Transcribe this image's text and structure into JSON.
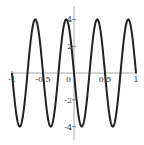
{
  "chart_data": {
    "type": "line",
    "title": "",
    "xlabel": "",
    "ylabel": "",
    "function": "-4*sin(4*pi*x)",
    "xlim": [
      -1,
      1
    ],
    "ylim": [
      -4.4,
      4.4
    ],
    "grid": false,
    "legend": null,
    "x_ticks": [
      -1,
      -0.5,
      0,
      0.5,
      1
    ],
    "x_tick_labels": [
      "-1",
      "-0.5",
      "0",
      "0.5",
      "1"
    ],
    "y_ticks": [
      -4,
      -2,
      2,
      4
    ],
    "y_tick_labels": [
      "-4",
      "-2",
      "2",
      "4"
    ],
    "series": [
      {
        "name": "f(x)",
        "color": "#222222",
        "x": [
          -1,
          -0.875,
          -0.75,
          -0.625,
          -0.5,
          -0.375,
          -0.25,
          -0.125,
          0,
          0.125,
          0.25,
          0.375,
          0.5,
          0.625,
          0.75,
          0.875,
          1
        ],
        "y": [
          0,
          -4,
          0,
          4,
          0,
          -4,
          0,
          4,
          0,
          -4,
          0,
          4,
          0,
          -4,
          0,
          4,
          0
        ]
      }
    ]
  }
}
